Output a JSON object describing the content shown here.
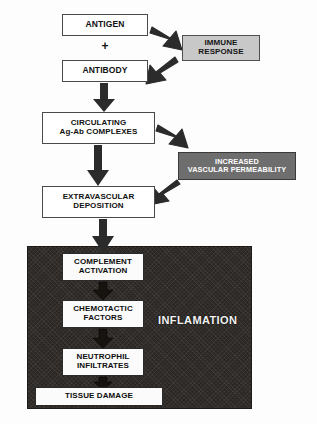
{
  "diagram": {
    "colors": {
      "page_background": "#fdfdfd",
      "box_fill_white": "#ffffff",
      "box_fill_light_gray": "#c8c8c8",
      "box_fill_dark_gray": "#6e6e6e",
      "panel_dark": "#2e2a27",
      "stroke": "#3a3a3a",
      "text_dark": "#111111",
      "text_light": "#ffffff"
    },
    "operators": [
      {
        "name": "plus-operator",
        "symbol": "+"
      }
    ],
    "nodes": [
      {
        "id": "antigen",
        "label": "ANTIGEN",
        "style": "white",
        "x": 62,
        "y": 14,
        "w": 86,
        "h": 22,
        "font": 8.5
      },
      {
        "id": "antibody",
        "label": "ANTIBODY",
        "style": "white",
        "x": 62,
        "y": 60,
        "w": 86,
        "h": 22,
        "font": 8.5
      },
      {
        "id": "immune",
        "label_line1": "IMMUNE",
        "label_line2": "RESPONSE",
        "style": "lightgray",
        "x": 182,
        "y": 35,
        "w": 78,
        "h": 26,
        "font": 8
      },
      {
        "id": "circulating",
        "label_line1": "CIRCULATING",
        "label_line2": "Ag-Ab COMPLEXES",
        "style": "white",
        "x": 42,
        "y": 112,
        "w": 113,
        "h": 32,
        "font": 8
      },
      {
        "id": "permeability",
        "label_line1": "INCREASED",
        "label_line2": "VASCULAR PERMEABILITY",
        "style": "darkgray",
        "x": 178,
        "y": 152,
        "w": 118,
        "h": 28,
        "font": 7.3
      },
      {
        "id": "extravascular",
        "label_line1": "EXTRAVASCULAR",
        "label_line2": "DEPOSITION",
        "style": "white",
        "x": 42,
        "y": 186,
        "w": 113,
        "h": 32,
        "font": 8
      },
      {
        "id": "complement",
        "label_line1": "COMPLEMENT",
        "label_line2": "ACTIVATION",
        "style": "inner",
        "x": 62,
        "y": 253,
        "w": 82,
        "h": 28,
        "font": 8
      },
      {
        "id": "chemotactic",
        "label_line1": "CHEMOTACTIC",
        "label_line2": "FACTORS",
        "style": "inner",
        "x": 62,
        "y": 300,
        "w": 82,
        "h": 28,
        "font": 8
      },
      {
        "id": "neutrophil",
        "label_line1": "NEUTROPHIL",
        "label_line2": "INFILTRATES",
        "style": "inner",
        "x": 62,
        "y": 348,
        "w": 82,
        "h": 28,
        "font": 8
      },
      {
        "id": "tissue-damage",
        "label": "TISSUE DAMAGE",
        "style": "inner",
        "x": 35,
        "y": 387,
        "w": 128,
        "h": 19,
        "font": 8
      }
    ],
    "panel": {
      "id": "inflammation-panel",
      "label": "INFLAMATION",
      "x": 27,
      "y": 246,
      "w": 223,
      "h": 161,
      "label_x": 158,
      "label_y": 314,
      "label_font": 11
    },
    "edges": [
      {
        "id": "antigen-to-immune",
        "from": "antigen",
        "to": "immune",
        "kind": "diagonal-down-right"
      },
      {
        "id": "immune-to-antibody",
        "from": "immune",
        "to": "antibody",
        "kind": "diagonal-down-left"
      },
      {
        "id": "antibody-to-circulating",
        "from": "antibody",
        "to": "circulating",
        "kind": "vertical-down"
      },
      {
        "id": "circulating-to-permeability",
        "from": "circulating",
        "to": "permeability",
        "kind": "diagonal-down-right"
      },
      {
        "id": "circulating-to-extravascular",
        "from": "circulating",
        "to": "extravascular",
        "kind": "vertical-down"
      },
      {
        "id": "permeability-to-extravascular",
        "from": "permeability",
        "to": "extravascular",
        "kind": "diagonal-down-left"
      },
      {
        "id": "extravascular-to-complement",
        "from": "extravascular",
        "to": "complement",
        "kind": "vertical-down"
      },
      {
        "id": "complement-to-chemotactic",
        "from": "complement",
        "to": "chemotactic",
        "kind": "vertical-down"
      },
      {
        "id": "chemotactic-to-neutrophil",
        "from": "chemotactic",
        "to": "neutrophil",
        "kind": "vertical-down"
      },
      {
        "id": "neutrophil-to-tissue-damage",
        "from": "neutrophil",
        "to": "tissue-damage",
        "kind": "vertical-down"
      }
    ]
  }
}
